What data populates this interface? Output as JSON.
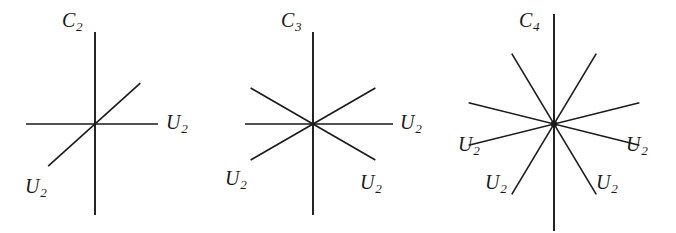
{
  "figure": {
    "background_color": "#ffffff",
    "line_color": "#1a1a1a",
    "width": 676,
    "height": 233
  },
  "panels": [
    {
      "id": "c2",
      "principal_axis_label": "C",
      "principal_axis_order": "2",
      "center": {
        "x": 95,
        "y": 124
      },
      "axes": [
        {
          "name": "principal-axis-c2",
          "type": "principal",
          "angle_deg": 90,
          "length_up": 92,
          "length_down": 91
        },
        {
          "name": "u2-axis-horizontal",
          "type": "u2",
          "angle_deg": 0,
          "length_pos": 63,
          "length_neg": 69
        },
        {
          "name": "u2-axis-diagonal",
          "type": "u2",
          "angle_deg": 42,
          "length_pos": 61,
          "length_neg": 63
        }
      ],
      "labels": [
        {
          "name": "label-principal-c2",
          "base": "C",
          "sub": "2",
          "x": 62,
          "y": 10
        },
        {
          "name": "label-u2-right",
          "base": "U",
          "sub": "2",
          "x": 166,
          "y": 112
        },
        {
          "name": "label-u2-lower-left",
          "base": "U",
          "sub": "2",
          "x": 25,
          "y": 176
        }
      ]
    },
    {
      "id": "c3",
      "principal_axis_label": "C",
      "principal_axis_order": "3",
      "center": {
        "x": 88,
        "y": 124
      },
      "axes": [
        {
          "name": "principal-axis-c3",
          "type": "principal",
          "angle_deg": 90,
          "length_up": 92,
          "length_down": 91
        },
        {
          "name": "u2-axis-horizontal",
          "type": "u2",
          "angle_deg": 0,
          "length_pos": 80,
          "length_neg": 68
        },
        {
          "name": "u2-axis-60",
          "type": "u2",
          "angle_deg": 30,
          "length_pos": 72,
          "length_neg": 72
        },
        {
          "name": "u2-axis-120",
          "type": "u2",
          "angle_deg": 150,
          "length_pos": 72,
          "length_neg": 72
        }
      ],
      "labels": [
        {
          "name": "label-principal-c3",
          "base": "C",
          "sub": "3",
          "x": 56,
          "y": 10
        },
        {
          "name": "label-u2-right",
          "base": "U",
          "sub": "2",
          "x": 175,
          "y": 112
        },
        {
          "name": "label-u2-lower-left",
          "base": "U",
          "sub": "2",
          "x": 0,
          "y": 168
        },
        {
          "name": "label-u2-lower-right",
          "base": "U",
          "sub": "2",
          "x": 135,
          "y": 172
        }
      ]
    },
    {
      "id": "c4",
      "principal_axis_label": "C",
      "principal_axis_order": "4",
      "center": {
        "x": 104,
        "y": 124
      },
      "axes": [
        {
          "name": "principal-axis-c4",
          "type": "principal",
          "angle_deg": 90,
          "length_up": 110,
          "length_down": 107
        },
        {
          "name": "u2-axis-shallow-right",
          "type": "u2",
          "angle_deg": 14,
          "length_pos": 88,
          "length_neg": 88
        },
        {
          "name": "u2-axis-shallow-left",
          "type": "u2",
          "angle_deg": 166,
          "length_pos": 88,
          "length_neg": 88
        },
        {
          "name": "u2-axis-steep-right",
          "type": "u2",
          "angle_deg": 59,
          "length_pos": 82,
          "length_neg": 82
        },
        {
          "name": "u2-axis-steep-left",
          "type": "u2",
          "angle_deg": 121,
          "length_pos": 82,
          "length_neg": 82
        }
      ],
      "labels": [
        {
          "name": "label-principal-c4",
          "base": "C",
          "sub": "4",
          "x": 69,
          "y": 10
        },
        {
          "name": "label-u2-left",
          "base": "U",
          "sub": "2",
          "x": 8,
          "y": 134
        },
        {
          "name": "label-u2-right",
          "base": "U",
          "sub": "2",
          "x": 176,
          "y": 134
        },
        {
          "name": "label-u2-lower-left",
          "base": "U",
          "sub": "2",
          "x": 35,
          "y": 172
        },
        {
          "name": "label-u2-lower-right",
          "base": "U",
          "sub": "2",
          "x": 146,
          "y": 172
        }
      ]
    }
  ]
}
